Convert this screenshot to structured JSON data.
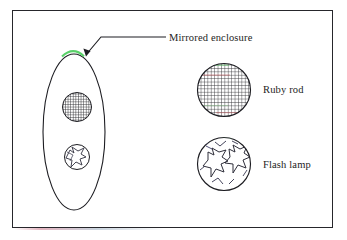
{
  "figure": {
    "type": "technical-line-diagram",
    "background_color": "#ffffff",
    "border_color": "#26262b",
    "ink_color": "#1d1d22",
    "highlight_color": "#5ad16a"
  },
  "labels": {
    "mirrored_enclosure": "Mirrored enclosure",
    "ruby_rod": "Ruby rod",
    "flash_lamp": "Flash lamp"
  },
  "shapes": {
    "enclosure": {
      "name": "mirrored-enclosure-ellipse",
      "center_x": 74,
      "center_y": 132,
      "radius_x": 31,
      "radius_y": 78,
      "mirror_arc_label": "green mirrored segment at apex"
    },
    "rod_cross_section": {
      "name": "ruby-rod-cross-section",
      "center_x": 77,
      "center_y": 107,
      "radius": 15,
      "fill_pattern": "cross-hatch grid"
    },
    "lamp_cross_section": {
      "name": "flash-lamp-cross-section",
      "center_x": 77,
      "center_y": 157,
      "radius": 13,
      "fill_pattern": "star coil"
    },
    "ruby_rod_detail": {
      "name": "ruby-rod-detail-circle",
      "center_x": 224,
      "center_y": 90,
      "radius": 27,
      "fill_pattern": "cross-hatch grid"
    },
    "flash_lamp_detail": {
      "name": "flash-lamp-detail-circle",
      "center_x": 224,
      "center_y": 164,
      "radius": 27,
      "fill_pattern": "double star coil"
    },
    "leader_line": {
      "name": "mirrored-enclosure-leader",
      "path": "M 166 37 L 101 37 L 86 55",
      "arrow_at": [
        86,
        55
      ]
    }
  }
}
